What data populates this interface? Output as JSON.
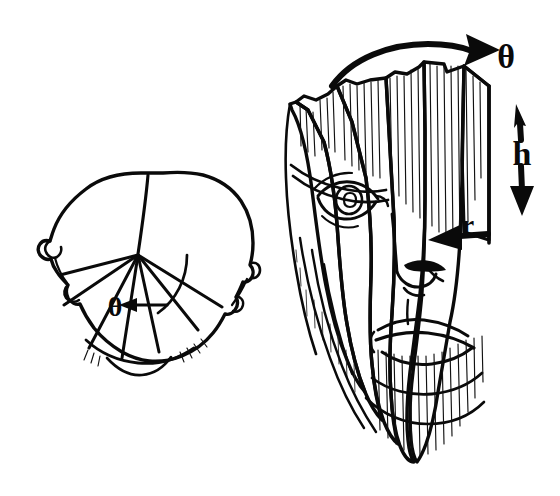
{
  "figure": {
    "title": "Cylindrical head unwrapping diagram",
    "background_color": "#ffffff",
    "ink_color": "#0a0a0a",
    "width": 560,
    "height": 496,
    "style": "hand-drawn black line art, no fill"
  },
  "panels": [
    {
      "id": "top-view",
      "name": "head-top-view",
      "position": "left",
      "description": "Top-down outline of a human head with ears, showing radial sector lines emanating from a central axis point and an arc marking the sweep angle",
      "center_point": {
        "x": 138,
        "y": 255
      },
      "radial_line_count": 6,
      "has_arc": true,
      "labels": [
        {
          "name": "theta-label-top-view",
          "text": "θ",
          "symbol": "theta",
          "x": 115,
          "y": 307,
          "font_size": 26,
          "arrow": "left-pointing",
          "description": "angle theta measured at the head axis"
        }
      ]
    },
    {
      "id": "unwrapped-view",
      "name": "face-unwrapped-view",
      "position": "right",
      "description": "The same face unrolled off the cylinder into vertical ribbon strips; eye, nose, lips and chin visible, with vertical hatching on the strip faces",
      "strip_count": 5,
      "labels": [
        {
          "name": "theta-label-unwrapped",
          "text": "θ",
          "symbol": "theta",
          "x": 494,
          "y": 58,
          "font_size": 30,
          "arrow": "curved-arc-arrow-right",
          "description": "rotation angle theta, curved arrow sweeping across the top of the unwrapped face"
        },
        {
          "name": "h-label",
          "text": "h",
          "symbol": "h",
          "x": 523,
          "y": 152,
          "font_size": 30,
          "arrow": "double-headed-vertical",
          "description": "height h, vertical double arrow along the right edge"
        },
        {
          "name": "r-label",
          "text": "r",
          "symbol": "r",
          "x": 466,
          "y": 238,
          "font_size": 26,
          "arrow": "left-pointing-horizontal",
          "description": "radius r, horizontal arrow pointing left into the face surface"
        }
      ]
    }
  ],
  "annotations": {
    "theta_top": "θ",
    "theta_side": "θ",
    "height": "h",
    "radius": "r"
  },
  "colors": {
    "ink": "#0a0a0a",
    "paper": "#ffffff",
    "hatch": "#111111"
  }
}
